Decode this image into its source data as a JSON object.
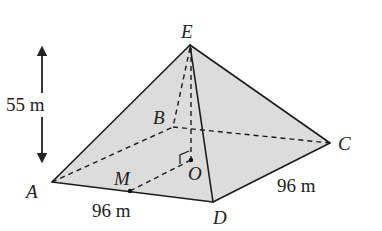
{
  "figure": {
    "type": "square-based pyramid",
    "vertices": {
      "apex": "E",
      "base": [
        "A",
        "B",
        "C",
        "D"
      ],
      "centre": "O",
      "midpoint": "M"
    },
    "labels": {
      "E": "E",
      "A": "A",
      "B": "B",
      "C": "C",
      "D": "D",
      "O": "O",
      "M": "M"
    },
    "measurements": {
      "height": "55 m",
      "side_AD": "96 m",
      "side_DC": "96 m"
    },
    "annotations": {
      "right_angle_at": "O",
      "height_arrow": "double-headed vertical arrow indicating height"
    },
    "colors": {
      "face_fill": "#dcdcdc",
      "line": "#1c1c1c"
    }
  }
}
